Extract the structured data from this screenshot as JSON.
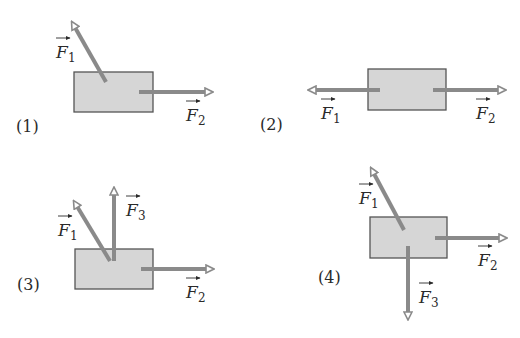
{
  "figure": {
    "colors": {
      "background": "#ffffff",
      "block_fill": "#d6d6d6",
      "block_stroke": "#555555",
      "arrow": "#8a8a8a",
      "text": "#2a2a2a"
    },
    "panels": [
      {
        "label": "(1)",
        "forces": [
          {
            "name": "F",
            "sub": "1",
            "direction": "up-left"
          },
          {
            "name": "F",
            "sub": "2",
            "direction": "right"
          }
        ]
      },
      {
        "label": "(2)",
        "forces": [
          {
            "name": "F",
            "sub": "1",
            "direction": "left"
          },
          {
            "name": "F",
            "sub": "2",
            "direction": "right"
          }
        ]
      },
      {
        "label": "(3)",
        "forces": [
          {
            "name": "F",
            "sub": "1",
            "direction": "up-left"
          },
          {
            "name": "F",
            "sub": "3",
            "direction": "up"
          },
          {
            "name": "F",
            "sub": "2",
            "direction": "right"
          }
        ]
      },
      {
        "label": "(4)",
        "forces": [
          {
            "name": "F",
            "sub": "1",
            "direction": "up-left"
          },
          {
            "name": "F",
            "sub": "2",
            "direction": "right"
          },
          {
            "name": "F",
            "sub": "3",
            "direction": "down"
          }
        ]
      }
    ]
  }
}
